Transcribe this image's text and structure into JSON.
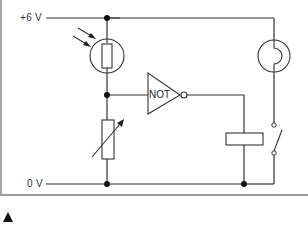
{
  "diagram": {
    "labels": {
      "positive_rail": "+6 V",
      "ground_rail": "0 V",
      "gate": "NOT"
    },
    "components": [
      {
        "id": "ldr",
        "type": "light-dependent-resistor",
        "position": "left branch, top"
      },
      {
        "id": "variable-resistor",
        "type": "variable-resistor",
        "position": "left branch, bottom"
      },
      {
        "id": "not-gate",
        "type": "NOT gate",
        "position": "center"
      },
      {
        "id": "relay-coil",
        "type": "relay coil",
        "position": "right-center"
      },
      {
        "id": "relay-switch",
        "type": "relay switch (normally open)",
        "position": "right branch"
      },
      {
        "id": "lamp",
        "type": "lamp",
        "position": "right branch, top"
      }
    ],
    "colors": {
      "wire": "#333333",
      "junction": "#111111",
      "frame": "#a0a0a0"
    }
  },
  "footer": {
    "marker": "figure-marker-triangle"
  }
}
